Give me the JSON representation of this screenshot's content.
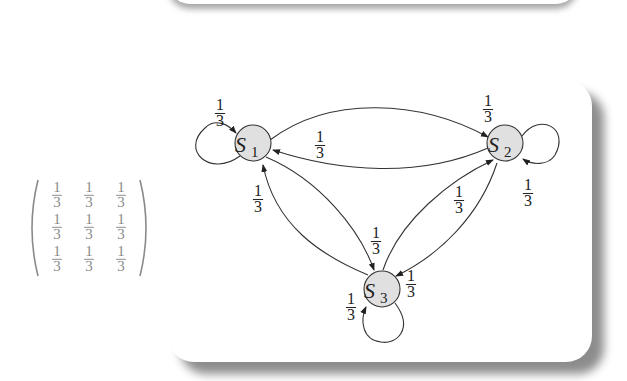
{
  "matrix": {
    "label": "transition matrix",
    "rows": [
      [
        "1/3",
        "1/3",
        "1/3"
      ],
      [
        "1/3",
        "1/3",
        "1/3"
      ],
      [
        "1/3",
        "1/3",
        "1/3"
      ]
    ],
    "numerator": "1",
    "denominator": "3"
  },
  "graph": {
    "node_fill": "#e0e0e0",
    "nodes": [
      {
        "id": "S1",
        "letter": "S",
        "sub": "1"
      },
      {
        "id": "S2",
        "letter": "S",
        "sub": "2"
      },
      {
        "id": "S3",
        "letter": "S",
        "sub": "3"
      }
    ],
    "edges": [
      {
        "from": "S1",
        "to": "S1",
        "prob": "1/3"
      },
      {
        "from": "S1",
        "to": "S2",
        "prob": "1/3"
      },
      {
        "from": "S2",
        "to": "S1",
        "prob": "1/3"
      },
      {
        "from": "S2",
        "to": "S2",
        "prob": "1/3"
      },
      {
        "from": "S1",
        "to": "S3",
        "prob": "1/3"
      },
      {
        "from": "S3",
        "to": "S1",
        "prob": "1/3"
      },
      {
        "from": "S3",
        "to": "S2",
        "prob": "1/3"
      },
      {
        "from": "S2",
        "to": "S3",
        "prob": "1/3"
      },
      {
        "from": "S3",
        "to": "S3",
        "prob": "1/3"
      }
    ],
    "labels": {
      "num": "1",
      "den": "3"
    }
  }
}
